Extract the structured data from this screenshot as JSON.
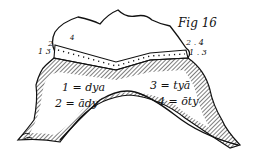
{
  "figure": {
    "title": "Fig 16",
    "left_markers": {
      "top": "4",
      "mid": "2",
      "low": "1 3"
    },
    "right_markers": {
      "top": "2 . 4",
      "bottom": "1 . 3"
    },
    "legend": [
      {
        "id": "1",
        "text": "1 = dya"
      },
      {
        "id": "2",
        "text": "2 = ādy"
      },
      {
        "id": "3",
        "text": "3 = tyā"
      },
      {
        "id": "4",
        "text": "4 = ōty"
      }
    ],
    "colors": {
      "ink": "#111111",
      "paper": "#ffffff"
    }
  }
}
